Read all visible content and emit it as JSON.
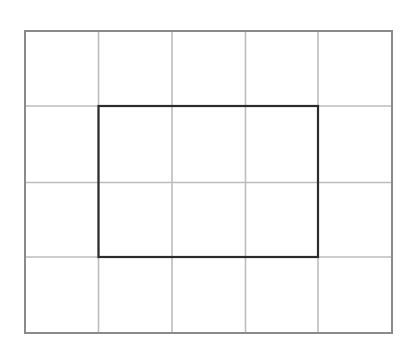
{
  "diagram": {
    "type": "grid-with-highlighted-rectangle",
    "grid": {
      "columns": 5,
      "rows": 4,
      "x_lines": [
        25,
        98.5,
        172,
        245.5,
        318,
        392
      ],
      "y_lines": [
        31,
        106,
        182.5,
        257,
        333
      ],
      "outer_border_color": "#8a8a8a",
      "inner_line_color": "#bdbdbd"
    },
    "highlight_rectangle": {
      "col_start": 1,
      "col_end": 4,
      "row_start": 1,
      "row_end": 3,
      "x": 98.5,
      "y": 106,
      "width": 219.5,
      "height": 151,
      "color": "#2b2b2b",
      "description": "3 columns by 2 rows rectangle outlined in bold"
    }
  }
}
